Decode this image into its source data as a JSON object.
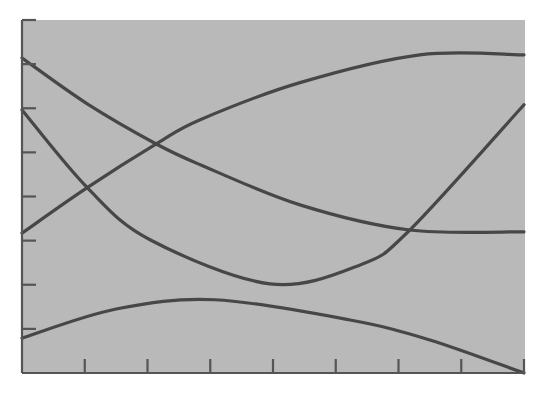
{
  "colors": {
    "background": "#ffffff",
    "plot_area": "#b9b9b9",
    "line": "#474747",
    "axis": "#555555"
  },
  "chart_data": {
    "type": "line",
    "title": "",
    "xlabel": "",
    "ylabel": "",
    "xlim": [
      0,
      8
    ],
    "ylim": [
      0,
      8
    ],
    "grid": false,
    "legend": null,
    "x_ticks": [
      1,
      2,
      3,
      4,
      5,
      6,
      7,
      8
    ],
    "y_ticks": [
      1,
      2,
      3,
      4,
      5,
      6,
      7,
      8
    ],
    "x_tick_labels": [],
    "y_tick_labels": [],
    "series": [
      {
        "name": "curve-falling",
        "x": [
          0,
          1.04,
          2.14,
          2.84,
          4.43,
          6.18,
          8.0
        ],
        "y": [
          7.14,
          6.1,
          5.19,
          4.72,
          3.81,
          3.24,
          3.2
        ]
      },
      {
        "name": "curve-rising",
        "x": [
          0,
          1.04,
          2.14,
          2.84,
          4.43,
          6.34,
          8.0
        ],
        "y": [
          3.17,
          4.2,
          5.19,
          5.74,
          6.58,
          7.21,
          7.21
        ]
      },
      {
        "name": "curve-u-shaped",
        "x": [
          0,
          1.04,
          2.04,
          3.95,
          5.39,
          6.18,
          8.0
        ],
        "y": [
          5.96,
          4.2,
          3.02,
          2.02,
          2.45,
          3.24,
          6.08
        ]
      },
      {
        "name": "curve-arch",
        "x": [
          0,
          1.5,
          3.08,
          5.23,
          6.5,
          8.0
        ],
        "y": [
          0.79,
          1.45,
          1.66,
          1.2,
          0.75,
          0.0
        ]
      }
    ]
  }
}
